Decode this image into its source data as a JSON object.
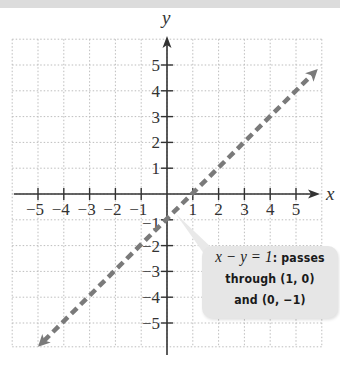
{
  "chart_data": {
    "type": "line",
    "title": "",
    "xlabel": "x",
    "ylabel": "y",
    "xlim": [
      -6,
      6
    ],
    "ylim": [
      -6,
      6
    ],
    "grid": true,
    "x_ticks": [
      -5,
      -4,
      -3,
      -2,
      -1,
      1,
      2,
      3,
      4,
      5
    ],
    "y_ticks": [
      5,
      4,
      3,
      2,
      1,
      -1,
      -2,
      -3,
      -4,
      -5
    ],
    "x_tick_labels": [
      "−5",
      "−4",
      "−3",
      "−2",
      "−1",
      "1",
      "2",
      "3",
      "4",
      "5"
    ],
    "y_tick_labels": [
      "5",
      "4",
      "3",
      "2",
      "1",
      "−1",
      "−2",
      "−3",
      "−4",
      "−5"
    ],
    "series": [
      {
        "name": "x − y = 1",
        "style": "dashed",
        "color": "#7a7a7a",
        "equation": "y = x - 1",
        "x": [
          -5,
          6
        ],
        "y": [
          -6,
          5
        ],
        "points_marked": [
          [
            1,
            0
          ],
          [
            0,
            -1
          ]
        ]
      }
    ],
    "annotations": [
      {
        "text": "x − y = 1: passes through (1, 0) and (0, −1)",
        "position": "lower-right"
      }
    ]
  },
  "callout": {
    "equation": "x − y = 1",
    "line1_rest": ": passes",
    "line2": "through (1, 0)",
    "line3": "and (0, −1)"
  },
  "axes": {
    "x_name": "x",
    "y_name": "y"
  },
  "colors": {
    "line": "#7a7a7a",
    "axis": "#333333",
    "grid": "#bdbdbd",
    "callout_bg": "#e6e6e6"
  }
}
